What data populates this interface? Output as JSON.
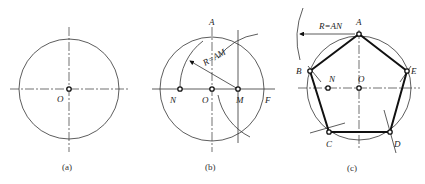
{
  "figure": {
    "panels": [
      {
        "id": "a",
        "caption": "(a)",
        "labels": {
          "O": "O"
        }
      },
      {
        "id": "b",
        "caption": "(b)",
        "labels": {
          "A": "A",
          "N": "N",
          "O": "O",
          "M": "M",
          "F": "F",
          "radius": "R=AM"
        }
      },
      {
        "id": "c",
        "caption": "(c)",
        "labels": {
          "A": "A",
          "B": "B",
          "C": "C",
          "D": "D",
          "E": "E",
          "N": "N",
          "O": "O",
          "radius": "R=AN"
        }
      }
    ]
  }
}
